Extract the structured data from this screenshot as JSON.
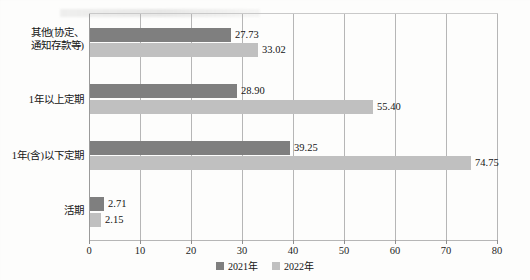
{
  "chart_data": {
    "type": "bar",
    "orientation": "horizontal",
    "title": "",
    "subtitle": "",
    "xlabel": "",
    "ylabel": "",
    "xlim": [
      0,
      80
    ],
    "xticks": [
      0,
      10,
      20,
      30,
      40,
      50,
      60,
      70,
      80
    ],
    "xtick_labels": [
      "0",
      "10",
      "20",
      "30",
      "40",
      "50",
      "60",
      "70",
      "80"
    ],
    "grid": true,
    "grid_axis": "x",
    "legend_position": "bottom-center",
    "categories": [
      "活期",
      "1年(含)以下定期",
      "1年以上定期",
      "其他(协定、通知存款等)"
    ],
    "category_order_top_to_bottom": [
      "其他(协定、通知存款等)",
      "1年以上定期",
      "1年(含)以下定期",
      "活期"
    ],
    "series": [
      {
        "name": "2021年",
        "color": "#7f7f7f",
        "values": [
          2.71,
          39.25,
          28.9,
          27.73
        ],
        "value_labels": [
          "2.71",
          "39.25",
          "28.90",
          "27.73"
        ]
      },
      {
        "name": "2022年",
        "color": "#c0c0c0",
        "values": [
          2.15,
          74.75,
          55.4,
          33.02
        ],
        "value_labels": [
          "2.15",
          "74.75",
          "55.40",
          "33.02"
        ]
      }
    ]
  },
  "legend": {
    "items": [
      {
        "label": "2021年",
        "color": "#7f7f7f"
      },
      {
        "label": "2022年",
        "color": "#c0c0c0"
      }
    ]
  },
  "axis": {
    "x_tick_labels": [
      "0",
      "10",
      "20",
      "30",
      "40",
      "50",
      "60",
      "70",
      "80"
    ]
  },
  "category_labels": {
    "other_line1": "其他(协定、",
    "other_line2": "通知存款等)",
    "over_one_year": "1年以上定期",
    "within_one_year": "1年(含)以下定期",
    "demand": "活期"
  },
  "value_labels": {
    "other_2021": "27.73",
    "other_2022": "33.02",
    "over_2021": "28.90",
    "over_2022": "55.40",
    "within_2021": "39.25",
    "within_2022": "74.75",
    "demand_2021": "2.71",
    "demand_2022": "2.15"
  }
}
